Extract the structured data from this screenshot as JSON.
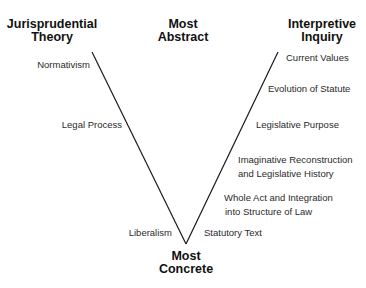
{
  "headers": {
    "left": [
      "Jurisprudential",
      "Theory"
    ],
    "center_top": [
      "Most",
      "Abstract"
    ],
    "right": [
      "Interpretive",
      "Inquiry"
    ],
    "bottom": [
      "Most",
      "Concrete"
    ]
  },
  "jurisprudential_theory": [
    {
      "label": "Normativism"
    },
    {
      "label": "Legal Process"
    },
    {
      "label": "Liberalism"
    }
  ],
  "interpretive_inquiry": [
    {
      "lines": [
        "Current Values"
      ]
    },
    {
      "lines": [
        "Evolution of Statute"
      ]
    },
    {
      "lines": [
        "Legislative Purpose"
      ]
    },
    {
      "lines": [
        "Imaginative Reconstruction",
        "and Legislative History"
      ]
    },
    {
      "lines": [
        "Whole Act and Integration",
        "into Structure of Law"
      ]
    },
    {
      "lines": [
        "Statutory Text"
      ]
    }
  ],
  "colors": {
    "line": "#1a1a1a",
    "text": "#2a2a2a",
    "background": "#ffffff"
  }
}
